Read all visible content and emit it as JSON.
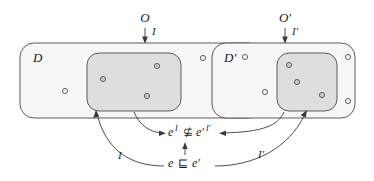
{
  "figure": {
    "kind": "set-containment-diagram",
    "title_text": "",
    "left": {
      "outer_label": "D",
      "inner_label": "",
      "source_label": "O",
      "edge_label": "I",
      "outer_dots": 5,
      "inner_dots": 3
    },
    "right": {
      "outer_label": "D′",
      "inner_label": "",
      "source_label": "O′",
      "edge_label": "I′",
      "outer_dots": 5,
      "inner_dots": 3
    },
    "relations": {
      "upper": {
        "lhs": "e",
        "lhs_sup": "I",
        "operator": "⊈",
        "rhs": "e′",
        "rhs_sup": "I′",
        "full_text": "e^I ⊈ e′^I′"
      },
      "lower": {
        "lhs": "e",
        "operator": "⊑",
        "rhs": "e′",
        "full_text": "e ⊑ e′"
      },
      "left_arrow_label": "I",
      "right_arrow_label": "I′"
    },
    "colors": {
      "outer_fill": "#f7f7f7",
      "inner_fill": "#dedede",
      "stroke": "#4a4a4a",
      "text": "#1a1a1a",
      "background": "#ffffff"
    }
  }
}
